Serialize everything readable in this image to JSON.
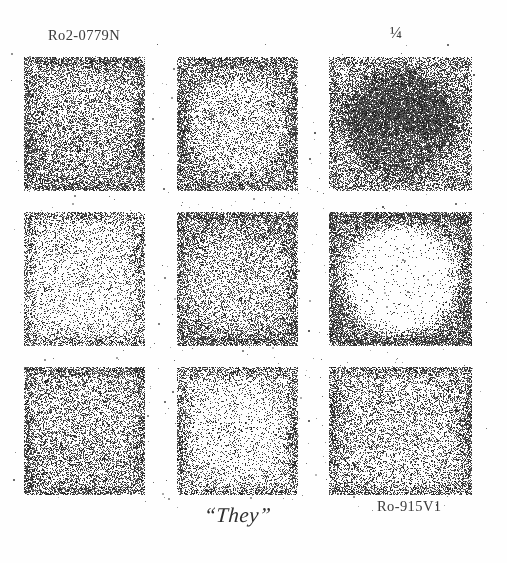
{
  "page": {
    "width": 507,
    "height": 563,
    "background_color": "#fefefe",
    "ink_color": "#2b2b2b",
    "medium": "halftone-stipple-scan"
  },
  "labels": {
    "top_left": "Ro2-0779N",
    "top_right": "¼",
    "bottom_center": "“They”",
    "bottom_right": "Ro-915V1"
  },
  "grid": {
    "rows": 3,
    "columns": 3,
    "left": 24,
    "top": 57,
    "width": 448,
    "height": 438,
    "gutter_has_scattered_dots": true,
    "tiles": [
      {
        "id": "tile-r1c1",
        "row": 1,
        "col": 1,
        "base_density": 0.52,
        "disk": "light",
        "disk_density": 0.4,
        "border_density": 0.78,
        "border": 13
      },
      {
        "id": "tile-r1c2",
        "row": 1,
        "col": 2,
        "base_density": 0.58,
        "disk": "light",
        "disk_density": 0.26,
        "border_density": 0.8,
        "border": 12
      },
      {
        "id": "tile-r1c3",
        "row": 1,
        "col": 3,
        "base_density": 0.5,
        "disk": "dark",
        "disk_density": 0.86,
        "border_density": 0.62,
        "border": 11
      },
      {
        "id": "tile-r2c1",
        "row": 2,
        "col": 1,
        "base_density": 0.22,
        "disk": "light",
        "disk_density": 0.18,
        "border_density": 0.62,
        "border": 14
      },
      {
        "id": "tile-r2c2",
        "row": 2,
        "col": 2,
        "base_density": 0.46,
        "disk": "light",
        "disk_density": 0.34,
        "border_density": 0.74,
        "border": 13
      },
      {
        "id": "tile-r2c3",
        "row": 2,
        "col": 3,
        "base_density": 0.56,
        "disk": "light",
        "disk_density": 0.04,
        "border_density": 0.82,
        "border": 15
      },
      {
        "id": "tile-r3c1",
        "row": 3,
        "col": 1,
        "base_density": 0.44,
        "disk": "light",
        "disk_density": 0.38,
        "border_density": 0.74,
        "border": 12
      },
      {
        "id": "tile-r3c2",
        "row": 3,
        "col": 2,
        "base_density": 0.34,
        "disk": "light",
        "disk_density": 0.14,
        "border_density": 0.72,
        "border": 12
      },
      {
        "id": "tile-r3c3",
        "row": 3,
        "col": 3,
        "base_density": 0.4,
        "disk": "light",
        "disk_density": 0.3,
        "border_density": 0.76,
        "border": 12
      }
    ]
  }
}
